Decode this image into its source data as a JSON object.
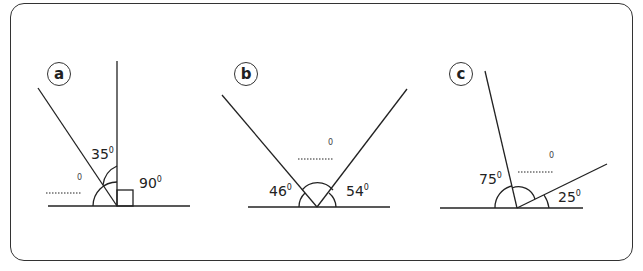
{
  "diagrams": [
    {
      "id": "a",
      "badge": "a",
      "angles": [
        {
          "value": "35",
          "unit": "0"
        },
        {
          "value": "90",
          "unit": "0"
        }
      ],
      "unknown": "0"
    },
    {
      "id": "b",
      "badge": "b",
      "angles": [
        {
          "value": "46",
          "unit": "0"
        },
        {
          "value": "54",
          "unit": "0"
        }
      ],
      "unknown": "0"
    },
    {
      "id": "c",
      "badge": "c",
      "angles": [
        {
          "value": "75",
          "unit": "0"
        },
        {
          "value": "25",
          "unit": "0"
        }
      ],
      "unknown": "0"
    }
  ]
}
